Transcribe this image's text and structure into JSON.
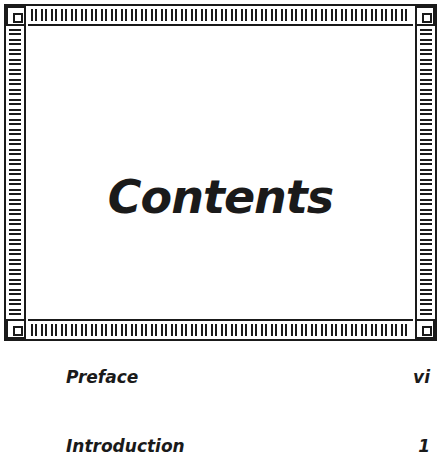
{
  "page": {
    "title": "Contents",
    "toc": [
      {
        "label": "Preface",
        "page": "vi"
      },
      {
        "label": "Introduction",
        "page": "1"
      }
    ]
  },
  "colors": {
    "ink": "#1a1a1a",
    "paper": "#ffffff"
  },
  "decoration": {
    "frame_icon": "greek-key-border"
  }
}
